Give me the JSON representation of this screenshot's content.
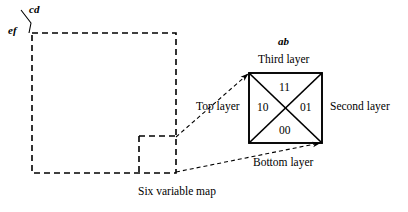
{
  "figure": {
    "caption": "Six variable map",
    "map_axis_labels": {
      "horizontal": "cd",
      "vertical": "ef"
    },
    "layer_square": {
      "top_variable_label": "ab",
      "edge_labels": {
        "top": "Third layer",
        "left": "Top layer",
        "right": "Second layer",
        "bottom": "Bottom layer"
      },
      "cells": {
        "top": "11",
        "left": "10",
        "right": "01",
        "bottom": "00"
      }
    },
    "colors": {
      "stroke": "#000000",
      "background": "#ffffff"
    }
  }
}
